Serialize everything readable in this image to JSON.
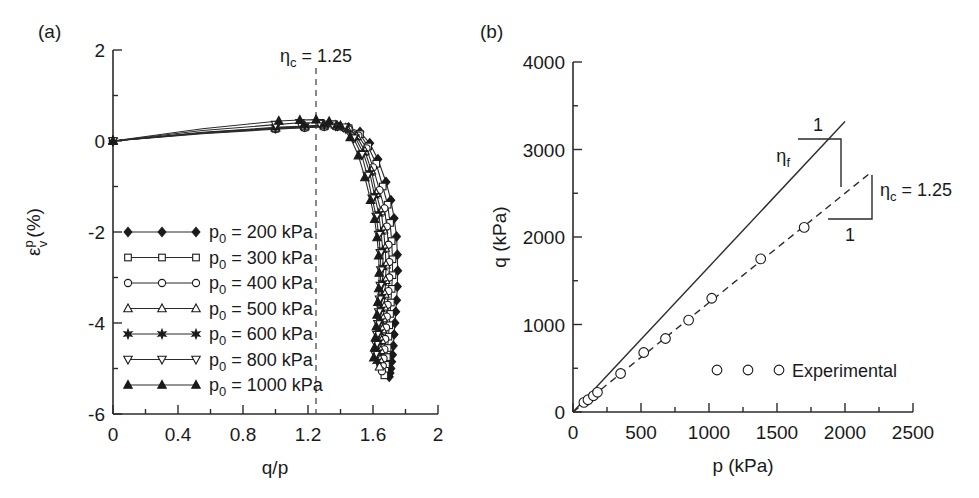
{
  "figure": {
    "panel_a_label": "(a)",
    "panel_b_label": "(b)"
  },
  "chart_data": [
    {
      "id": "panel_a",
      "type": "line",
      "title": "(a)",
      "xlabel": "q/p",
      "ylabel": "εv^p (%)",
      "ylabel_base": "ε",
      "ylabel_sup": "p",
      "ylabel_sub": "v",
      "ylabel_unit": "(%)",
      "xlim": [
        0,
        2
      ],
      "ylim": [
        -6,
        2
      ],
      "xticks": [
        0,
        0.4,
        0.8,
        1.2,
        1.6,
        2
      ],
      "xticklabels": [
        "0",
        "0.4",
        "0.8",
        "1.2",
        "1.6",
        "2"
      ],
      "xminorstep": 0.2,
      "yticks": [
        2,
        0,
        -2,
        -4,
        -6
      ],
      "yticklabels": [
        "2",
        "0",
        "-2",
        "-4",
        "-6"
      ],
      "yminorstep": 1,
      "grid": false,
      "legend_position": "center-left",
      "annotations": [
        {
          "name": "eta-c-vline",
          "text": "ηc = 1.25",
          "base": "η",
          "sub": "c",
          "rest": " = 1.25",
          "x": 1.25,
          "style": "vertical-dashed"
        }
      ],
      "series": [
        {
          "name": "p0 = 200 kPa",
          "label_base": "p",
          "label_sub": "0",
          "label_rest": " = 200 kPa",
          "marker": "filled-diamond",
          "x": [
            0.0,
            0.55,
            1.0,
            1.18,
            1.3,
            1.38,
            1.45,
            1.52,
            1.58,
            1.63,
            1.68,
            1.71,
            1.73,
            1.745,
            1.75,
            1.752,
            1.75,
            1.745,
            1.74,
            1.735,
            1.73,
            1.725,
            1.72,
            1.715,
            1.71,
            1.705,
            1.7
          ],
          "y": [
            0.0,
            0.18,
            0.28,
            0.31,
            0.33,
            0.33,
            0.3,
            0.2,
            -0.05,
            -0.4,
            -0.9,
            -1.3,
            -1.7,
            -2.1,
            -2.5,
            -2.85,
            -3.2,
            -3.5,
            -3.75,
            -4.0,
            -4.25,
            -4.5,
            -4.7,
            -4.85,
            -5.0,
            -5.1,
            -5.18
          ]
        },
        {
          "name": "p0 = 300 kPa",
          "label_base": "p",
          "label_sub": "0",
          "label_rest": " = 300 kPa",
          "marker": "open-square",
          "x": [
            0.0,
            0.55,
            1.0,
            1.18,
            1.3,
            1.38,
            1.45,
            1.52,
            1.57,
            1.62,
            1.66,
            1.69,
            1.705,
            1.715,
            1.72,
            1.72,
            1.715,
            1.71,
            1.705,
            1.7,
            1.695,
            1.69,
            1.685,
            1.68,
            1.675,
            1.67
          ],
          "y": [
            0.0,
            0.17,
            0.27,
            0.3,
            0.32,
            0.32,
            0.28,
            0.15,
            -0.12,
            -0.5,
            -1.0,
            -1.4,
            -1.8,
            -2.2,
            -2.6,
            -2.95,
            -3.25,
            -3.55,
            -3.8,
            -4.05,
            -4.3,
            -4.55,
            -4.75,
            -4.92,
            -5.05,
            -5.15
          ]
        },
        {
          "name": "p0 = 400 kPa",
          "label_base": "p",
          "label_sub": "0",
          "label_rest": " = 400 kPa",
          "marker": "open-circle",
          "x": [
            0.0,
            0.55,
            1.0,
            1.18,
            1.3,
            1.38,
            1.45,
            1.51,
            1.56,
            1.6,
            1.64,
            1.67,
            1.685,
            1.695,
            1.7,
            1.7,
            1.695,
            1.69,
            1.685,
            1.68,
            1.675,
            1.67,
            1.665,
            1.66,
            1.655
          ],
          "y": [
            0.0,
            0.16,
            0.26,
            0.29,
            0.31,
            0.31,
            0.26,
            0.12,
            -0.16,
            -0.58,
            -1.08,
            -1.48,
            -1.88,
            -2.28,
            -2.66,
            -3.0,
            -3.3,
            -3.6,
            -3.86,
            -4.1,
            -4.35,
            -4.58,
            -4.78,
            -4.94,
            -5.06
          ]
        },
        {
          "name": "p0 = 500 kPa",
          "label_base": "p",
          "label_sub": "0",
          "label_rest": " = 500 kPa",
          "marker": "open-triangle-up",
          "x": [
            0.0,
            0.55,
            1.0,
            1.18,
            1.3,
            1.38,
            1.44,
            1.5,
            1.55,
            1.59,
            1.62,
            1.65,
            1.665,
            1.675,
            1.68,
            1.678,
            1.673,
            1.668,
            1.663,
            1.658,
            1.653,
            1.648,
            1.643,
            1.64
          ],
          "y": [
            0.0,
            0.18,
            0.29,
            0.32,
            0.34,
            0.33,
            0.28,
            0.1,
            -0.22,
            -0.65,
            -1.15,
            -1.55,
            -1.95,
            -2.35,
            -2.72,
            -3.06,
            -3.36,
            -3.64,
            -3.9,
            -4.14,
            -4.38,
            -4.6,
            -4.8,
            -4.96
          ]
        },
        {
          "name": "p0 = 600 kPa",
          "label_base": "p",
          "label_sub": "0",
          "label_rest": " = 600 kPa",
          "marker": "star",
          "x": [
            0.0,
            0.55,
            1.0,
            1.18,
            1.3,
            1.37,
            1.43,
            1.49,
            1.54,
            1.58,
            1.61,
            1.635,
            1.65,
            1.66,
            1.662,
            1.66,
            1.655,
            1.65,
            1.645,
            1.64,
            1.635,
            1.63,
            1.625
          ],
          "y": [
            0.0,
            0.19,
            0.3,
            0.33,
            0.35,
            0.34,
            0.28,
            0.08,
            -0.26,
            -0.7,
            -1.2,
            -1.6,
            -2.0,
            -2.4,
            -2.78,
            -3.12,
            -3.42,
            -3.7,
            -3.96,
            -4.2,
            -4.42,
            -4.64,
            -4.84
          ]
        },
        {
          "name": "p0 = 800 kPa",
          "label_base": "p",
          "label_sub": "0",
          "label_rest": " = 800 kPa",
          "marker": "open-triangle-down",
          "x": [
            0.0,
            0.55,
            1.0,
            1.15,
            1.27,
            1.35,
            1.42,
            1.48,
            1.53,
            1.565,
            1.595,
            1.62,
            1.635,
            1.645,
            1.648,
            1.645,
            1.64,
            1.635,
            1.63,
            1.625,
            1.62,
            1.615
          ],
          "y": [
            0.0,
            0.23,
            0.36,
            0.4,
            0.4,
            0.37,
            0.3,
            0.06,
            -0.3,
            -0.76,
            -1.26,
            -1.66,
            -2.06,
            -2.46,
            -2.84,
            -3.18,
            -3.48,
            -3.76,
            -4.02,
            -4.26,
            -4.48,
            -4.7
          ]
        },
        {
          "name": "p0 = 1000 kPa",
          "label_base": "p",
          "label_sub": "0",
          "label_rest": " = 1000 kPa",
          "marker": "filled-triangle-up",
          "x": [
            0.0,
            0.55,
            1.02,
            1.15,
            1.25,
            1.33,
            1.4,
            1.46,
            1.51,
            1.55,
            1.585,
            1.61,
            1.625,
            1.635,
            1.638,
            1.635,
            1.63,
            1.625,
            1.62,
            1.615,
            1.61,
            1.605
          ],
          "y": [
            0.0,
            0.27,
            0.44,
            0.46,
            0.47,
            0.43,
            0.34,
            0.08,
            -0.32,
            -0.8,
            -1.3,
            -1.72,
            -2.12,
            -2.52,
            -2.9,
            -3.24,
            -3.54,
            -3.82,
            -4.08,
            -4.32,
            -4.54,
            -4.76
          ]
        }
      ]
    },
    {
      "id": "panel_b",
      "type": "scatter",
      "title": "(b)",
      "xlabel": "p (kPa)",
      "ylabel": "q (kPa)",
      "xlim": [
        0,
        2500
      ],
      "ylim": [
        0,
        4000
      ],
      "xticks": [
        0,
        500,
        1000,
        1500,
        2000,
        2500
      ],
      "xticklabels": [
        "0",
        "500",
        "1000",
        "1500",
        "2000",
        "2500"
      ],
      "xminorstep": 250,
      "yticks": [
        0,
        1000,
        2000,
        3000,
        4000
      ],
      "yticklabels": [
        "0",
        "1000",
        "2000",
        "3000",
        "4000"
      ],
      "yminorstep": 500,
      "grid": false,
      "legend_position": "lower-right",
      "legend_entries": [
        {
          "name": "experimental",
          "label": "Experimental",
          "marker": "open-circle"
        }
      ],
      "series": [
        {
          "name": "Experimental",
          "marker": "open-circle",
          "x": [
            80,
            110,
            150,
            180,
            350,
            520,
            680,
            850,
            1020,
            1380,
            1700
          ],
          "y": [
            110,
            140,
            185,
            225,
            440,
            680,
            840,
            1050,
            1300,
            1750,
            2110
          ]
        }
      ],
      "lines": [
        {
          "name": "eta-f-line",
          "style": "solid",
          "x": [
            0,
            2000
          ],
          "y": [
            0,
            3320
          ]
        },
        {
          "name": "eta-c-line",
          "style": "dashed",
          "slope": 1.25,
          "x": [
            0,
            2200
          ],
          "y": [
            0,
            2750
          ]
        }
      ],
      "annotations": [
        {
          "name": "eta-f-slope-triangle",
          "base": "η",
          "sub": "f",
          "rest": "",
          "rise_label": "1",
          "run_label": ""
        },
        {
          "name": "eta-c-slope-triangle",
          "base": "η",
          "sub": "c",
          "rest": " = 1.25",
          "rise_label": "",
          "run_label": "1"
        }
      ]
    }
  ]
}
